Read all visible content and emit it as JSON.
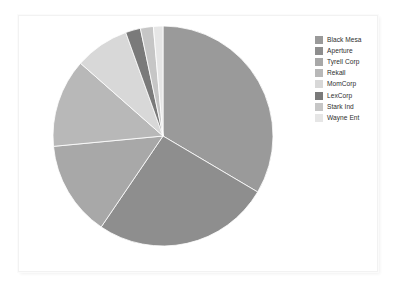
{
  "chart_data": {
    "type": "pie",
    "title": "",
    "labels": [
      "Black Mesa",
      "Aperture",
      "Tyrell Corp",
      "Rekall",
      "MomCorp",
      "LexCorp",
      "Stark Ind",
      "Wayne Ent"
    ],
    "values": [
      33.5,
      26.0,
      14.0,
      13.0,
      8.0,
      2.2,
      1.9,
      1.4
    ],
    "units": "percent",
    "start_angle_deg": 0,
    "direction": "clockwise",
    "colors": [
      "#9a9a9a",
      "#8e8e8e",
      "#a8a8a8",
      "#b8b8b8",
      "#d8d8d8",
      "#7a7a7a",
      "#c6c6c6",
      "#e6e6e6"
    ],
    "legend_position": "right",
    "grid": false,
    "xlabel": "",
    "ylabel": "",
    "slices": [
      {
        "label": "Black Mesa",
        "value": 33.5,
        "color": "#9a9a9a"
      },
      {
        "label": "Aperture",
        "value": 26.0,
        "color": "#8e8e8e"
      },
      {
        "label": "Tyrell Corp",
        "value": 14.0,
        "color": "#a8a8a8"
      },
      {
        "label": "Rekall",
        "value": 13.0,
        "color": "#b8b8b8"
      },
      {
        "label": "MomCorp",
        "value": 8.0,
        "color": "#d8d8d8"
      },
      {
        "label": "LexCorp",
        "value": 2.2,
        "color": "#7a7a7a"
      },
      {
        "label": "Stark Ind",
        "value": 1.9,
        "color": "#c6c6c6"
      },
      {
        "label": "Wayne Ent",
        "value": 1.4,
        "color": "#e6e6e6"
      }
    ]
  },
  "legend": {
    "entries": [
      {
        "label": "Black Mesa",
        "color": "#9a9a9a"
      },
      {
        "label": "Aperture",
        "color": "#8e8e8e"
      },
      {
        "label": "Tyrell Corp",
        "color": "#a8a8a8"
      },
      {
        "label": "Rekall",
        "color": "#b8b8b8"
      },
      {
        "label": "MomCorp",
        "color": "#d8d8d8"
      },
      {
        "label": "LexCorp",
        "color": "#7a7a7a"
      },
      {
        "label": "Stark Ind",
        "color": "#c6c6c6"
      },
      {
        "label": "Wayne Ent",
        "color": "#e6e6e6"
      }
    ]
  },
  "canvas": {
    "background": "#ffffff",
    "border_color": "#f2f2f2"
  }
}
